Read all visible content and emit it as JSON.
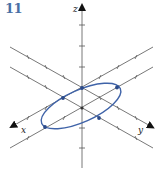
{
  "problem": {
    "number": "11"
  },
  "axes": {
    "x_label": "x",
    "y_label": "y",
    "z_label": "z"
  },
  "colors": {
    "number": "#4a6fa5",
    "curve": "#3f63a8",
    "point": "#2b4a8a",
    "line": "#555555"
  },
  "curve": {
    "type": "ellipse",
    "marked_points": 6
  }
}
